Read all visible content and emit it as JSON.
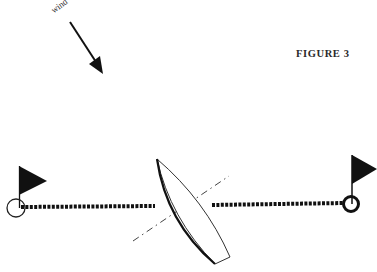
{
  "figure": {
    "title": "FIGURE 3",
    "wind_label": "wind"
  },
  "elements": {
    "wind_arrow": {
      "from": [
        70,
        22
      ],
      "to": [
        103,
        73
      ],
      "icon": "arrow-down-right-icon"
    },
    "left_mark": {
      "icon": "flag-icon",
      "buoy": "circle",
      "position": [
        16,
        207
      ]
    },
    "right_mark": {
      "icon": "flag-icon",
      "buoy": "circle-bold",
      "position": [
        351,
        203
      ]
    },
    "start_line": {
      "style": "dotted",
      "from": [
        20,
        207
      ],
      "to": [
        348,
        203
      ]
    },
    "boat": {
      "shape": "hull-outline",
      "bow": [
        157,
        159
      ],
      "stern": [
        [
          215,
          264
        ],
        [
          230,
          257
        ]
      ]
    },
    "heading_line": {
      "style": "dash-dot",
      "from": [
        133,
        241
      ],
      "to": [
        228,
        177
      ]
    }
  },
  "colors": {
    "ink": "#000000",
    "text": "#2a2a2a",
    "background": "#ffffff"
  }
}
